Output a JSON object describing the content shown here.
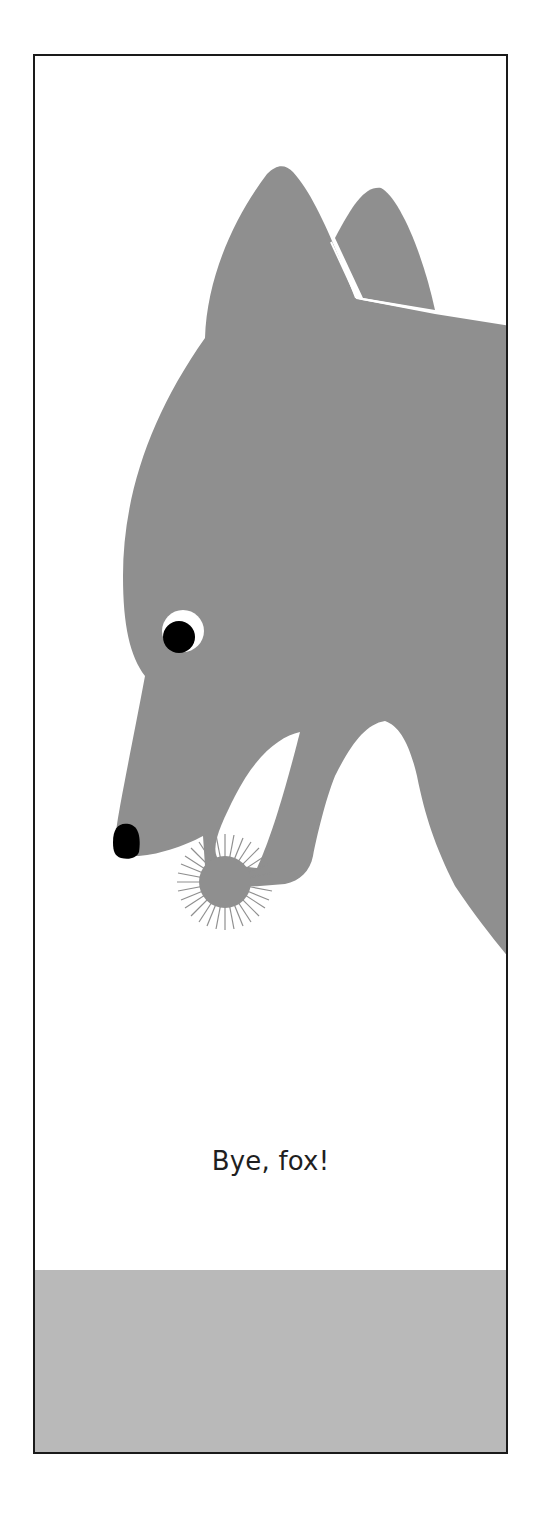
{
  "page": {
    "caption": "Bye, fox!",
    "colors": {
      "wolf_gray": "#8f8f8f",
      "ground_gray": "#b9b9b9",
      "frame_border": "#1a1a1a",
      "eye_black": "#000000",
      "background": "#ffffff"
    },
    "illustration": {
      "subject": "gray wolf head in profile holding a spiky ball (fox) in its mouth",
      "elements": [
        "wolf-head",
        "ear-front",
        "ear-back",
        "eye",
        "nose",
        "open-mouth",
        "spiky-ball",
        "ground"
      ]
    }
  }
}
